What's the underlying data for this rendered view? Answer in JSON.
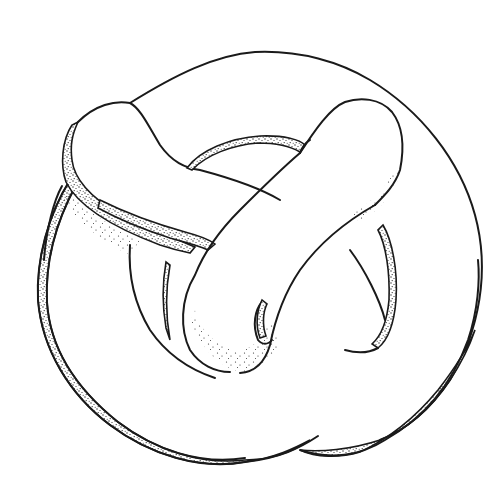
{
  "figure": {
    "title": "Knotted tube illustration",
    "subject": "knot",
    "style": "pen-and-ink line drawing with stippled shading",
    "colors": {
      "ink": "#1a1a1a",
      "paper": "#ffffff",
      "stipple": "#2a2a2a"
    },
    "parts": [
      {
        "name": "outer-arc",
        "description": "large outer loop sweeping over the top and right"
      },
      {
        "name": "left-lobe",
        "description": "upper-left rounded end of tube with stippled rim"
      },
      {
        "name": "right-lobe",
        "description": "upper-right rounded end of tube"
      },
      {
        "name": "crossing-strand",
        "description": "diagonal strand crossing the center from upper-right to lower-left"
      },
      {
        "name": "left-ring",
        "description": "large lower-left ring with stippled outer band"
      },
      {
        "name": "inner-hole",
        "description": "small central opening with shaded interior"
      },
      {
        "name": "right-ring",
        "description": "lower-right ring with stippled band"
      }
    ]
  }
}
